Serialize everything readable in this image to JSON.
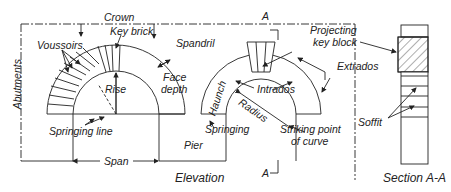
{
  "diagram": {
    "views": [
      {
        "name": "elevation",
        "caption": "Elevation"
      },
      {
        "name": "section",
        "caption": "Section A-A"
      }
    ],
    "labels": {
      "crown": "Crown",
      "key_brick": "Key brick",
      "voussoirs": "Voussoirs",
      "abutments": "Abutments",
      "spandril": "Spandril",
      "face_depth": "Face depth",
      "rise": "Rise",
      "springing_line": "Springing line",
      "span": "Span",
      "haunch": "Haunch",
      "intrados": "Intrados",
      "radius": "Radius",
      "springing": "Springing",
      "pier": "Pier",
      "striking_point": "Striking point of curve",
      "projecting_key_block": "Projecting key block",
      "extrados": "Extrados",
      "soffit": "Soffit",
      "section_mark_top": "A",
      "section_mark_bottom": "A"
    },
    "captions": {
      "elevation": "Elevation",
      "section": "Section A-A"
    }
  }
}
